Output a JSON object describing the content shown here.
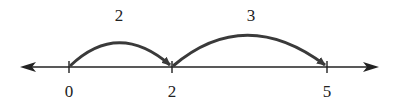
{
  "diagram": {
    "type": "number-line-jumps",
    "number_line": {
      "ticks": [
        {
          "value": "0",
          "x": 69
        },
        {
          "value": "2",
          "x": 172
        },
        {
          "value": "5",
          "x": 327
        }
      ]
    },
    "jumps": [
      {
        "from": "0",
        "to": "2",
        "label": "2"
      },
      {
        "from": "2",
        "to": "5",
        "label": "3"
      }
    ],
    "colors": {
      "line": "#222222",
      "arc": "#3a3a3a"
    }
  }
}
